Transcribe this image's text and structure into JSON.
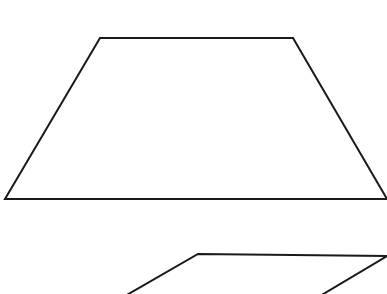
{
  "diagram": {
    "background": "#ffffff",
    "stroke_color": "#1a1a1a",
    "stroke_width": 2,
    "shapes": [
      {
        "name": "trapezoid",
        "points": [
          [
            100,
            38
          ],
          [
            293,
            38
          ],
          [
            387,
            199
          ],
          [
            5,
            199
          ]
        ]
      },
      {
        "name": "parallelogram",
        "points": [
          [
            198,
            254
          ],
          [
            387,
            256
          ],
          [
            320,
            296
          ],
          [
            125,
            296
          ]
        ]
      }
    ]
  }
}
